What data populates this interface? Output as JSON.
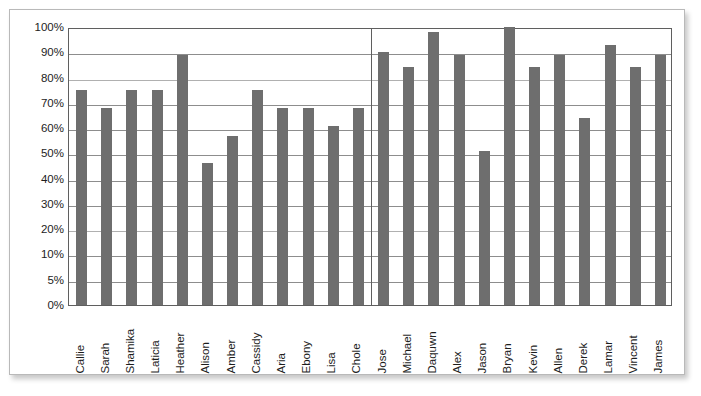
{
  "chart_data": {
    "type": "bar",
    "title": "",
    "subtitle": "",
    "xlabel": "",
    "ylabel": "",
    "legend": [],
    "grid": true,
    "bar_color": "#6e6e6e",
    "axis_color": "#5f5f5f",
    "gridline_color": "#8d8d8d",
    "y_tick_labels": [
      "100%",
      "90%",
      "80%",
      "70%",
      "60%",
      "50%",
      "40%",
      "30%",
      "20%",
      "10%",
      "5%",
      "0%"
    ],
    "y_tick_values": [
      100,
      90,
      80,
      70,
      60,
      50,
      40,
      30,
      20,
      10,
      5,
      0
    ],
    "y_axis_note": "evenly spaced category ticks (non-linear between 0%, 5% and 10%)",
    "ylim": [
      0,
      100
    ],
    "group_divider_after_index": 11,
    "groups": [
      {
        "name": "group-1",
        "categories": [
          "Callie",
          "Sarah",
          "Shamika",
          "Laticia",
          "Heather",
          "Alison",
          "Amber",
          "Cassidy",
          "Aria",
          "Ebony",
          "Lisa",
          "Chole"
        ],
        "values": [
          75,
          68,
          75,
          75,
          89,
          46,
          57,
          75,
          68,
          68,
          61,
          68
        ]
      },
      {
        "name": "group-2",
        "categories": [
          "Jose",
          "Michael",
          "Daquwn",
          "Alex",
          "Jason",
          "Bryan",
          "Kevin",
          "Allen",
          "Derek",
          "Lamar",
          "Vincent",
          "James"
        ],
        "values": [
          90,
          84,
          98,
          89,
          51,
          100,
          84,
          89,
          64,
          93,
          84,
          89
        ]
      }
    ],
    "categories": [
      "Callie",
      "Sarah",
      "Shamika",
      "Laticia",
      "Heather",
      "Alison",
      "Amber",
      "Cassidy",
      "Aria",
      "Ebony",
      "Lisa",
      "Chole",
      "Jose",
      "Michael",
      "Daquwn",
      "Alex",
      "Jason",
      "Bryan",
      "Kevin",
      "Allen",
      "Derek",
      "Lamar",
      "Vincent",
      "James"
    ],
    "values": [
      75,
      68,
      75,
      75,
      89,
      46,
      57,
      75,
      68,
      68,
      61,
      68,
      90,
      84,
      98,
      89,
      51,
      100,
      84,
      89,
      64,
      93,
      84,
      89
    ]
  }
}
